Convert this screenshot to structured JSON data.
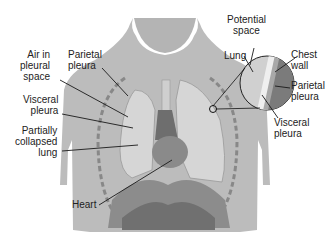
{
  "diagram": {
    "labels": {
      "air_in_pleural_space": "Air in\npleural\nspace",
      "parietal_pleura_left": "Parietal\npleura",
      "visceral_pleura_left": "Visceral\npleura",
      "partially_collapsed_lung": "Partially\ncollapsed\nlung",
      "heart": "Heart",
      "potential_space": "Potential\nspace",
      "lung": "Lung",
      "chest_wall": "Chest\nwall",
      "parietal_pleura_right": "Parietal\npleura",
      "visceral_pleura_right": "Visceral\npleura"
    },
    "colors": {
      "body": "#b9b9b9",
      "body_dark": "#a6a6a6",
      "lung": "#d4d4d4",
      "lung_outline": "#9a9a9a",
      "heart": "#7a7a7a",
      "diaphragm": "#8c8c8c",
      "chest_wall_inset": "#777777",
      "leader_line": "#1a1a1a"
    }
  }
}
